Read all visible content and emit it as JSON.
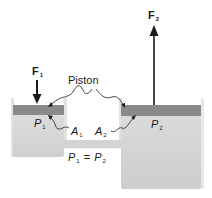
{
  "diagram": {
    "labels": {
      "f1": {
        "base": "F",
        "sub": "1"
      },
      "f2": {
        "base": "F",
        "sub": "2"
      },
      "piston": "Piston",
      "p1": {
        "base": "P",
        "sub": "1"
      },
      "p2": {
        "base": "P",
        "sub": "2"
      },
      "a1": {
        "base": "A",
        "sub": "1"
      },
      "a2": {
        "base": "A",
        "sub": "2"
      },
      "equation": {
        "left": {
          "base": "P",
          "sub": "1"
        },
        "op": "=",
        "right": {
          "base": "P",
          "sub": "2"
        }
      }
    },
    "colors": {
      "piston": "#8a8a8a",
      "fluid": "#d6d6d6",
      "wall": "#e4e4e4",
      "arrow": "#1a1a1a"
    }
  }
}
